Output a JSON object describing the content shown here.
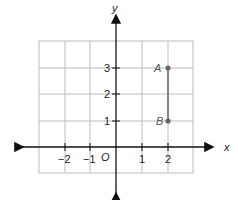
{
  "diagram": {
    "type": "coordinate-plane",
    "axes": {
      "x_label": "x",
      "y_label": "y",
      "origin_label": "O"
    },
    "x_ticks": [
      "−2",
      "−1",
      "1",
      "2"
    ],
    "y_ticks": [
      "1",
      "2",
      "3"
    ],
    "grid": {
      "x_range": [
        -3,
        3
      ],
      "y_range": [
        -1,
        4
      ]
    },
    "points": [
      {
        "label": "A",
        "x": 2,
        "y": 3
      },
      {
        "label": "B",
        "x": 2,
        "y": 1
      }
    ],
    "segments": [
      {
        "from": "A",
        "to": "B"
      }
    ],
    "colors": {
      "grid": "#bbbbbb",
      "axis": "#111111",
      "point": "#666666"
    }
  }
}
